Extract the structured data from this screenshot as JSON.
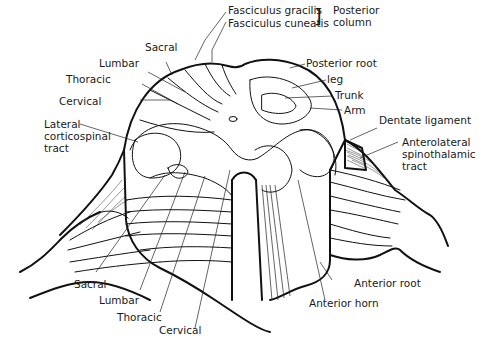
{
  "figure": {
    "labels": {
      "fasciculus_gracilis": "Fasciculus gracilis",
      "fasciculus_cuneatis": "Fasciculus cuneatis",
      "posterior_column_1": "Posterior",
      "posterior_column_2": "column",
      "sacral_top": "Sacral",
      "lumbar_top": "Lumbar",
      "thoracic_top": "Thoracic",
      "cervical_top": "Cervical",
      "lateral_cst_1": "Lateral",
      "lateral_cst_2": "corticospinal",
      "lateral_cst_3": "tract",
      "posterior_root": "Posterior root",
      "leg": "leg",
      "trunk": "Trunk",
      "arm": "Arm",
      "dentate_ligament": "Dentate ligament",
      "anterolateral_1": "Anterolateral",
      "anterolateral_2": "spinothalamic",
      "anterolateral_3": "tract",
      "sacral_bottom": "Sacral",
      "lumbar_bottom": "Lumbar",
      "thoracic_bottom": "Thoracic",
      "cervical_bottom": "Cervical",
      "anterior_root": "Anterior root",
      "anterior_horn": "Anterior horn"
    }
  }
}
